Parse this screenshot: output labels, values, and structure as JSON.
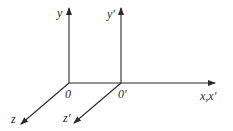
{
  "diagram": {
    "frames": [
      {
        "origin_label": "0",
        "y_label": "y",
        "z_label": "z"
      },
      {
        "origin_label": "0'",
        "y_label": "y'",
        "z_label": "z'"
      }
    ],
    "x_label": "x,x'",
    "colors": {
      "line": "#2a2a2a",
      "background": "#ffffff"
    }
  }
}
